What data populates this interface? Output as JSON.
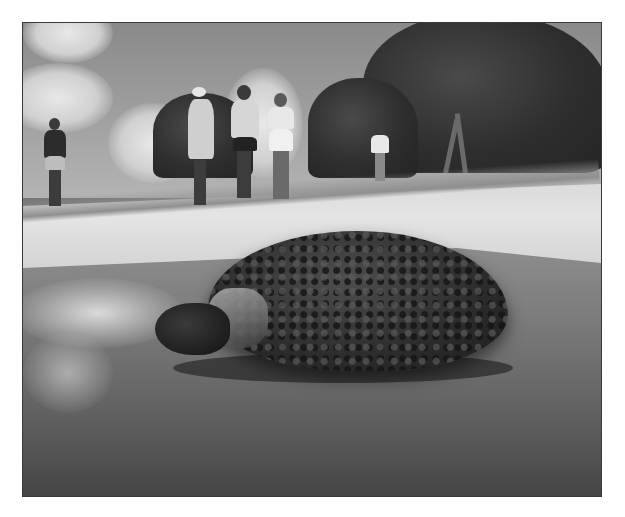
{
  "image": {
    "subject": "Sea turtle emerging from surf onto a sandy beach, watched by people",
    "style": "black-and-white photograph",
    "elements": {
      "sky": "cloudy sky, upper left",
      "trees": "dense trees, upper right",
      "people": [
        "person-left-standing",
        "person-with-hat",
        "person-center",
        "person-woman-shorts",
        "person-far-right"
      ],
      "beach": "sand with tire track line",
      "surf": "foamy water lower left",
      "turtle": "large sea turtle foreground center"
    },
    "colors": {
      "border": "#3a3a3a",
      "sky": "#9c9c9c",
      "sand": "#e0e0e0",
      "water": "#6a6a6a",
      "turtle": "#2c2c2c"
    }
  }
}
